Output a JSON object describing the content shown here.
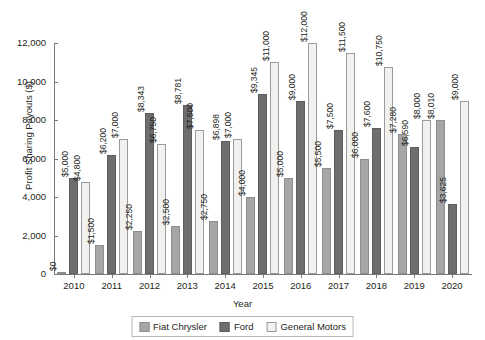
{
  "chart_data": {
    "type": "bar",
    "title": "",
    "xlabel": "Year",
    "ylabel": "Profit Sharing Payouts ($)",
    "ylim": [
      0,
      12000
    ],
    "yticks": [
      0,
      2000,
      4000,
      6000,
      8000,
      10000,
      12000
    ],
    "ytick_labels": [
      "0",
      "2,000",
      "4,000",
      "6,000",
      "8,000",
      "10,000",
      "12,000"
    ],
    "grid": false,
    "legend_position": "bottom",
    "categories": [
      "2010",
      "2011",
      "2012",
      "2013",
      "2014",
      "2015",
      "2016",
      "2017",
      "2018",
      "2019",
      "2020"
    ],
    "series": [
      {
        "name": "Fiat Chrysler",
        "color": "#a6a6a8",
        "values": [
          0,
          1500,
          2250,
          2500,
          2750,
          4000,
          5000,
          5500,
          6000,
          7280,
          8010
        ],
        "labels": [
          "$0",
          "$1,500",
          "$2,250",
          "$2,500",
          "$2,750",
          "$4,000",
          "$5,000",
          "$5,500",
          "$6,000",
          "$7,280",
          "$8,010"
        ]
      },
      {
        "name": "Ford",
        "color": "#6e6e71",
        "values": [
          5000,
          6200,
          8343,
          8781,
          6898,
          9345,
          9000,
          7500,
          7600,
          6590,
          3625
        ],
        "labels": [
          "$5,000",
          "$6,200",
          "$8,343",
          "$8,781",
          "$6,898",
          "$9,345",
          "$9,000",
          "$7,500",
          "$7,600",
          "$6,590",
          "$3,625"
        ]
      },
      {
        "name": "General Motors",
        "color": "#f1f1ef",
        "values": [
          4800,
          7000,
          6750,
          7500,
          7000,
          11000,
          12000,
          11500,
          10750,
          8000,
          9000
        ],
        "labels": [
          "$4,800",
          "$7,000",
          "$6,750",
          "$7,500",
          "$7,000",
          "$11,000",
          "$12,000",
          "$11,500",
          "$10,750",
          "$8,000",
          "$9,000"
        ]
      }
    ]
  },
  "legend": {
    "items": [
      {
        "label": "Fiat Chrysler"
      },
      {
        "label": "Ford"
      },
      {
        "label": "General Motors"
      }
    ]
  }
}
